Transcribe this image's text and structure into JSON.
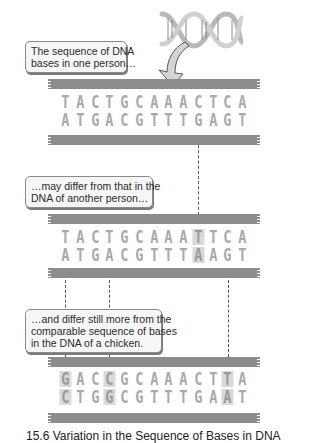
{
  "figure": {
    "caption": "15.6 Variation in the Sequence of Bases in DNA",
    "icons": {
      "helix": "dna-double-helix-icon",
      "arrow": "curved-arrow-icon"
    },
    "colors": {
      "strand": "#8c8c8c",
      "base": "#a9a9a9",
      "highlight": "#d9d9d9"
    }
  },
  "panels": [
    {
      "label": "The sequence of DNA bases in one person…",
      "label_lines": [
        "The sequence of DNA",
        "bases in one person…"
      ],
      "top": [
        "T",
        "A",
        "C",
        "T",
        "G",
        "C",
        "A",
        "A",
        "A",
        "C",
        "T",
        "C",
        "A"
      ],
      "bottom": [
        "A",
        "T",
        "G",
        "A",
        "C",
        "G",
        "T",
        "T",
        "T",
        "G",
        "A",
        "G",
        "T"
      ],
      "highlight_indices": []
    },
    {
      "label": "…may differ from that in the DNA of another person…",
      "label_lines": [
        "…may differ from that in the",
        "DNA of another person…"
      ],
      "top": [
        "T",
        "A",
        "C",
        "T",
        "G",
        "C",
        "A",
        "A",
        "A",
        "T",
        "T",
        "C",
        "A"
      ],
      "bottom": [
        "A",
        "T",
        "G",
        "A",
        "C",
        "G",
        "T",
        "T",
        "T",
        "A",
        "A",
        "G",
        "T"
      ],
      "highlight_indices": [
        9
      ]
    },
    {
      "label": "…and differ still more from the comparable sequence of bases in the DNA of a chicken.",
      "label_lines": [
        "…and differ still more from the",
        "comparable sequence of bases",
        "in the DNA of a chicken."
      ],
      "top": [
        "G",
        "A",
        "C",
        "C",
        "G",
        "C",
        "A",
        "A",
        "A",
        "C",
        "T",
        "T",
        "A"
      ],
      "bottom": [
        "C",
        "T",
        "G",
        "G",
        "C",
        "G",
        "T",
        "T",
        "T",
        "G",
        "A",
        "A",
        "T"
      ],
      "highlight_indices": [
        0,
        3,
        11
      ]
    }
  ]
}
